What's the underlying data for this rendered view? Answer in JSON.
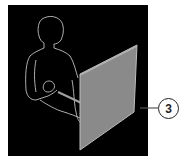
{
  "figure": {
    "callout": {
      "label": "3"
    },
    "colors": {
      "background": "#000000",
      "panel": "#8a8a8a",
      "outline": "#d8d8d8",
      "page": "#ffffff"
    }
  }
}
